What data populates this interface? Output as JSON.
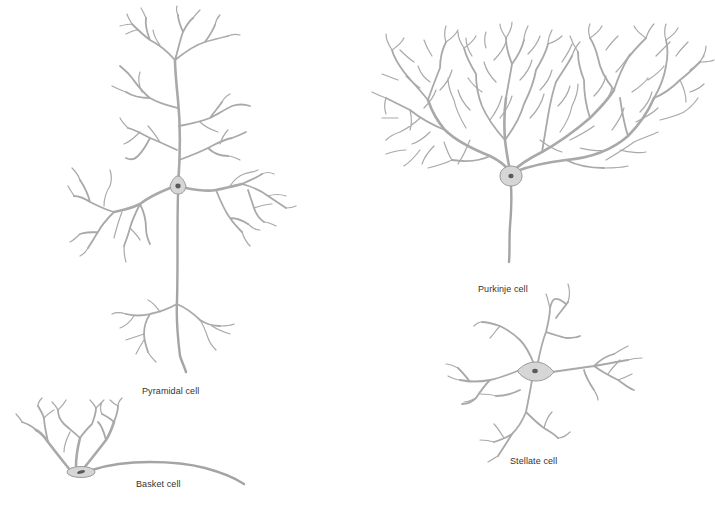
{
  "figure": {
    "background": "#ffffff",
    "dendrite_color": "#a9a9a9",
    "soma_color": "#d6d6d6",
    "nucleus_color": "#5a5a5a",
    "label_color": "#333333"
  },
  "cells": [
    {
      "id": "pyramidal",
      "label": "Pyramidal cell"
    },
    {
      "id": "basket",
      "label": "Basket cell"
    },
    {
      "id": "purkinje",
      "label": "Purkinje cell"
    },
    {
      "id": "stellate",
      "label": "Stellate cell"
    }
  ]
}
